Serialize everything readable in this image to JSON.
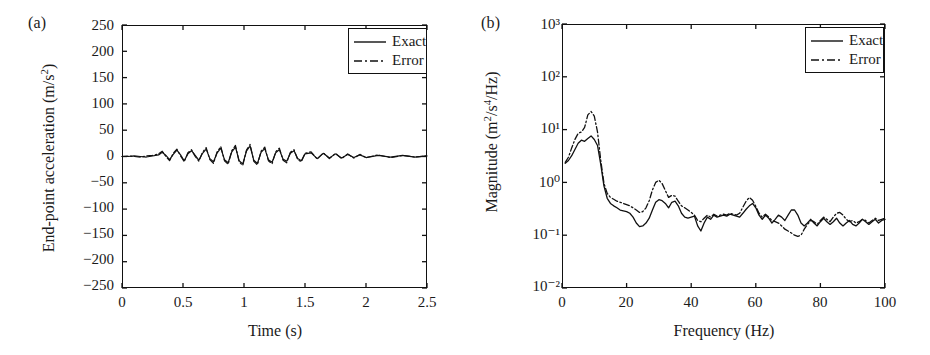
{
  "figure": {
    "panels": [
      {
        "tag": "(a)",
        "xlabel": "Time (s)",
        "ylabel_prefix": "End-point acceleration (m/s",
        "ylabel_exp": "2",
        "ylabel_suffix": ")",
        "xticks": [
          "0",
          "0.5",
          "1",
          "1.5",
          "2",
          "2.5"
        ],
        "yticks": [
          "250",
          "200",
          "150",
          "100",
          "50",
          "0",
          "−50",
          "−100",
          "−150",
          "−200",
          "−250"
        ],
        "legend": [
          {
            "label": "Exact",
            "style": "solid"
          },
          {
            "label": "Error",
            "style": "dashdot"
          }
        ]
      },
      {
        "tag": "(b)",
        "xlabel": "Frequency (Hz)",
        "ylabel_prefix": "Magnitude (m",
        "ylabel_exp1": "2",
        "ylabel_mid": "/s",
        "ylabel_exp2": "4",
        "ylabel_suffix": "/Hz)",
        "xticks": [
          "0",
          "20",
          "40",
          "60",
          "80",
          "100"
        ],
        "yticks": [
          "10³",
          "10²",
          "10¹",
          "10⁰",
          "10⁻¹",
          "10⁻²"
        ],
        "legend": [
          {
            "label": "Exact",
            "style": "solid"
          },
          {
            "label": "Error",
            "style": "dashdot"
          }
        ]
      }
    ]
  },
  "chart_data": [
    {
      "type": "line",
      "panel": "(a)",
      "title": "",
      "xlabel": "Time (s)",
      "ylabel": "End-point acceleration (m/s^2)",
      "xlim": [
        0,
        2.5
      ],
      "ylim": [
        -250,
        250
      ],
      "xticks": [
        0,
        0.5,
        1,
        1.5,
        2,
        2.5
      ],
      "yticks": [
        -250,
        -200,
        -150,
        -100,
        -50,
        0,
        50,
        100,
        150,
        200,
        250
      ],
      "grid": false,
      "legend_position": "top-right",
      "series": [
        {
          "name": "Exact",
          "style": "solid",
          "color": "#111111",
          "x": [
            0.0,
            0.05,
            0.1,
            0.15,
            0.2,
            0.25,
            0.3,
            0.33,
            0.36,
            0.39,
            0.42,
            0.45,
            0.48,
            0.51,
            0.54,
            0.57,
            0.6,
            0.63,
            0.66,
            0.69,
            0.72,
            0.75,
            0.78,
            0.81,
            0.84,
            0.87,
            0.9,
            0.93,
            0.96,
            0.99,
            1.02,
            1.05,
            1.08,
            1.11,
            1.14,
            1.17,
            1.2,
            1.23,
            1.26,
            1.29,
            1.32,
            1.35,
            1.38,
            1.41,
            1.44,
            1.47,
            1.5,
            1.55,
            1.6,
            1.65,
            1.7,
            1.75,
            1.8,
            1.85,
            1.9,
            1.95,
            2.0,
            2.1,
            2.2,
            2.3,
            2.4,
            2.5
          ],
          "y": [
            0,
            0,
            1,
            0,
            -1,
            1,
            3,
            8,
            2,
            -6,
            4,
            12,
            3,
            -8,
            5,
            11,
            2,
            -7,
            6,
            14,
            -4,
            -10,
            7,
            16,
            -6,
            -12,
            9,
            18,
            -8,
            -14,
            10,
            20,
            -7,
            -13,
            8,
            15,
            -6,
            -11,
            7,
            13,
            -5,
            -9,
            6,
            11,
            -4,
            -8,
            5,
            7,
            -4,
            6,
            -3,
            5,
            -3,
            4,
            -2,
            3,
            -2,
            2,
            -1,
            2,
            -1,
            1
          ]
        },
        {
          "name": "Error",
          "style": "dashdot",
          "color": "#111111",
          "x": [
            0.0,
            0.05,
            0.1,
            0.15,
            0.2,
            0.25,
            0.3,
            0.33,
            0.36,
            0.39,
            0.42,
            0.45,
            0.48,
            0.51,
            0.54,
            0.57,
            0.6,
            0.63,
            0.66,
            0.69,
            0.72,
            0.75,
            0.78,
            0.81,
            0.84,
            0.87,
            0.9,
            0.93,
            0.96,
            0.99,
            1.02,
            1.05,
            1.08,
            1.11,
            1.14,
            1.17,
            1.2,
            1.23,
            1.26,
            1.29,
            1.32,
            1.35,
            1.38,
            1.41,
            1.44,
            1.47,
            1.5,
            1.55,
            1.6,
            1.65,
            1.7,
            1.75,
            1.8,
            1.85,
            1.9,
            1.95,
            2.0,
            2.1,
            2.2,
            2.3,
            2.4,
            2.5
          ],
          "y": [
            0,
            1,
            0,
            -1,
            1,
            2,
            5,
            10,
            0,
            -8,
            6,
            14,
            1,
            -10,
            7,
            13,
            0,
            -9,
            8,
            17,
            -6,
            -13,
            9,
            19,
            -8,
            -15,
            11,
            21,
            -10,
            -17,
            12,
            23,
            -9,
            -16,
            10,
            18,
            -8,
            -14,
            9,
            16,
            -7,
            -12,
            8,
            13,
            -6,
            -10,
            6,
            9,
            -5,
            7,
            -4,
            6,
            -4,
            5,
            -3,
            4,
            -2,
            3,
            -2,
            2,
            -1,
            1
          ]
        }
      ]
    },
    {
      "type": "line",
      "panel": "(b)",
      "title": "",
      "xlabel": "Frequency (Hz)",
      "ylabel": "Magnitude (m^2/s^4/Hz)",
      "xlim": [
        0,
        100
      ],
      "ylim": [
        0.01,
        1000
      ],
      "yscale": "log",
      "xticks": [
        0,
        20,
        40,
        60,
        80,
        100
      ],
      "yticks": [
        0.01,
        0.1,
        1,
        10,
        100,
        1000
      ],
      "grid": false,
      "legend_position": "top-right",
      "series": [
        {
          "name": "Exact",
          "style": "solid",
          "color": "#111111",
          "x": [
            1,
            2,
            3,
            4,
            5,
            6,
            7,
            8,
            9,
            10,
            11,
            12,
            13,
            14,
            15,
            16,
            17,
            18,
            19,
            20,
            21,
            22,
            23,
            24,
            25,
            26,
            27,
            28,
            29,
            30,
            31,
            32,
            33,
            34,
            35,
            36,
            37,
            38,
            39,
            40,
            41,
            42,
            43,
            44,
            45,
            46,
            47,
            48,
            49,
            50,
            51,
            52,
            53,
            54,
            55,
            56,
            57,
            58,
            59,
            60,
            61,
            62,
            63,
            64,
            65,
            66,
            67,
            68,
            69,
            70,
            71,
            72,
            73,
            74,
            75,
            76,
            77,
            78,
            79,
            80,
            81,
            82,
            83,
            84,
            85,
            86,
            87,
            88,
            89,
            90,
            91,
            92,
            93,
            94,
            95,
            96,
            97,
            98,
            99,
            100
          ],
          "y": [
            2.3,
            2.6,
            3.2,
            4.2,
            5.5,
            6.3,
            6.0,
            6.8,
            7.6,
            6.5,
            5.0,
            2.2,
            0.85,
            0.5,
            0.4,
            0.36,
            0.33,
            0.3,
            0.29,
            0.28,
            0.26,
            0.22,
            0.17,
            0.145,
            0.15,
            0.17,
            0.21,
            0.3,
            0.42,
            0.47,
            0.45,
            0.4,
            0.33,
            0.42,
            0.44,
            0.36,
            0.26,
            0.22,
            0.21,
            0.22,
            0.23,
            0.15,
            0.12,
            0.17,
            0.22,
            0.2,
            0.24,
            0.22,
            0.23,
            0.24,
            0.23,
            0.25,
            0.24,
            0.23,
            0.22,
            0.26,
            0.31,
            0.36,
            0.4,
            0.33,
            0.24,
            0.2,
            0.24,
            0.21,
            0.17,
            0.2,
            0.24,
            0.22,
            0.19,
            0.24,
            0.3,
            0.3,
            0.24,
            0.17,
            0.15,
            0.17,
            0.2,
            0.17,
            0.15,
            0.18,
            0.21,
            0.18,
            0.16,
            0.18,
            0.21,
            0.17,
            0.15,
            0.17,
            0.19,
            0.16,
            0.15,
            0.17,
            0.2,
            0.18,
            0.16,
            0.18,
            0.2,
            0.17,
            0.19,
            0.2
          ]
        },
        {
          "name": "Error",
          "style": "dashdot",
          "color": "#111111",
          "x": [
            1,
            2,
            3,
            4,
            5,
            6,
            7,
            8,
            9,
            10,
            11,
            12,
            13,
            14,
            15,
            16,
            17,
            18,
            19,
            20,
            21,
            22,
            23,
            24,
            25,
            26,
            27,
            28,
            29,
            30,
            31,
            32,
            33,
            34,
            35,
            36,
            37,
            38,
            39,
            40,
            41,
            42,
            43,
            44,
            45,
            46,
            47,
            48,
            49,
            50,
            51,
            52,
            53,
            54,
            55,
            56,
            57,
            58,
            59,
            60,
            61,
            62,
            63,
            64,
            65,
            66,
            67,
            68,
            69,
            70,
            71,
            72,
            73,
            74,
            75,
            76,
            77,
            78,
            79,
            80,
            81,
            82,
            83,
            84,
            85,
            86,
            87,
            88,
            89,
            90,
            91,
            92,
            93,
            94,
            95,
            96,
            97,
            98,
            99,
            100
          ],
          "y": [
            2.4,
            3.0,
            4.5,
            6.5,
            8.5,
            9.0,
            11.0,
            19.0,
            22.0,
            18.0,
            9.0,
            2.6,
            0.95,
            0.62,
            0.52,
            0.48,
            0.44,
            0.42,
            0.4,
            0.38,
            0.36,
            0.33,
            0.3,
            0.27,
            0.28,
            0.33,
            0.45,
            0.72,
            1.0,
            1.1,
            0.95,
            0.7,
            0.52,
            0.57,
            0.55,
            0.44,
            0.36,
            0.33,
            0.3,
            0.27,
            0.24,
            0.19,
            0.18,
            0.21,
            0.24,
            0.22,
            0.25,
            0.23,
            0.24,
            0.25,
            0.24,
            0.26,
            0.25,
            0.24,
            0.26,
            0.34,
            0.44,
            0.52,
            0.46,
            0.35,
            0.26,
            0.22,
            0.25,
            0.22,
            0.19,
            0.18,
            0.17,
            0.15,
            0.13,
            0.12,
            0.11,
            0.1,
            0.095,
            0.1,
            0.13,
            0.16,
            0.19,
            0.18,
            0.16,
            0.19,
            0.22,
            0.2,
            0.18,
            0.22,
            0.26,
            0.27,
            0.24,
            0.2,
            0.18,
            0.19,
            0.17,
            0.18,
            0.2,
            0.19,
            0.17,
            0.19,
            0.21,
            0.19,
            0.2,
            0.21
          ]
        }
      ]
    }
  ]
}
